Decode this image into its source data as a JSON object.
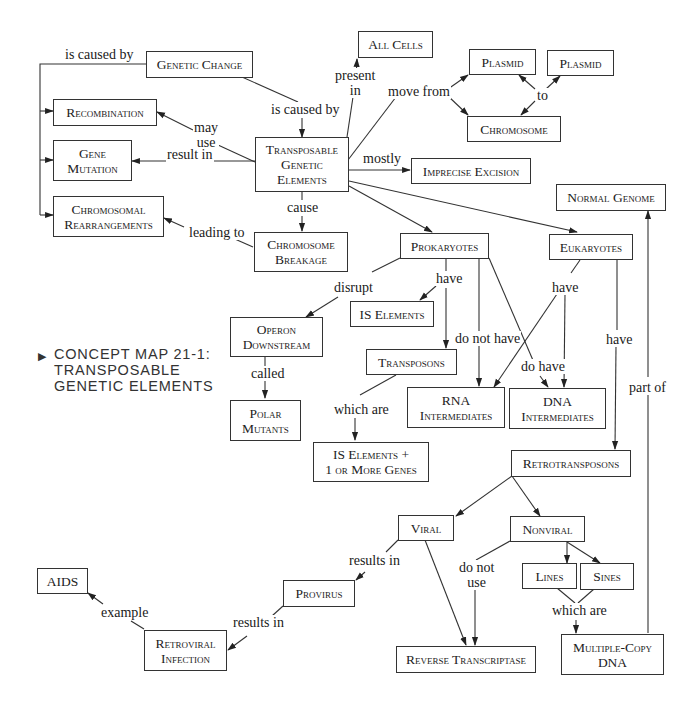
{
  "caption": {
    "marker": "▶",
    "text": "CONCEPT MAP 21-1:\nTRANSPOSABLE\nGENETIC ELEMENTS"
  },
  "nodes": {
    "genetic_change": "Genetic Change",
    "all_cells": "All Cells",
    "plasmid_1": "Plasmid",
    "plasmid_2": "Plasmid",
    "chromosome": "Chromosome",
    "recombination": "Recombination",
    "gene_mutation": "Gene\nMutation",
    "transposable": "Transposable\nGenetic\nElements",
    "imprecise_excision": "Imprecise Excision",
    "chromosomal_rearrangements": "Chromosomal\nRearrangements",
    "chromosome_breakage": "Chromosome\nBreakage",
    "normal_genome": "Normal Genome",
    "prokaryotes": "Prokaryotes",
    "eukaryotes": "Eukaryotes",
    "operon_downstream": "Operon\nDownstream",
    "is_elements": "IS Elements",
    "transposons": "Transposons",
    "polar_mutants": "Polar\nMutants",
    "rna_intermediates": "RNA\nIntermediates",
    "dna_intermediates": "DNA\nIntermediates",
    "is_elements_genes": "IS Elements +\n1 or More Genes",
    "retrotransposons": "Retrotransposons",
    "viral": "Viral",
    "nonviral": "Nonviral",
    "lines": "Lines",
    "sines": "Sines",
    "aids": "AIDS",
    "provirus": "Provirus",
    "retroviral_infection": "Retroviral\nInfection",
    "reverse_transcriptase": "Reverse Transcriptase",
    "multiple_copy_dna": "Multiple-Copy\nDNA"
  },
  "links": {
    "is_caused_by_left": "is caused by",
    "is_caused_by": "is caused by",
    "present_in": "present\nin",
    "move_from": "move from",
    "to": "to",
    "may_use": "may\nuse",
    "result_in": "result in",
    "mostly": "mostly",
    "cause": "cause",
    "leading_to": "leading to",
    "disrupt": "disrupt",
    "have_prok": "have",
    "have_euk": "have",
    "do_not_have": "do not have",
    "do_have": "do have",
    "have_retro": "have",
    "called": "called",
    "which_are_transposons": "which are",
    "part_of": "part of",
    "results_in_viral": "results in",
    "do_not_use": "do not\nuse",
    "which_are_lines": "which are",
    "example": "example",
    "results_in_provirus": "results in"
  }
}
